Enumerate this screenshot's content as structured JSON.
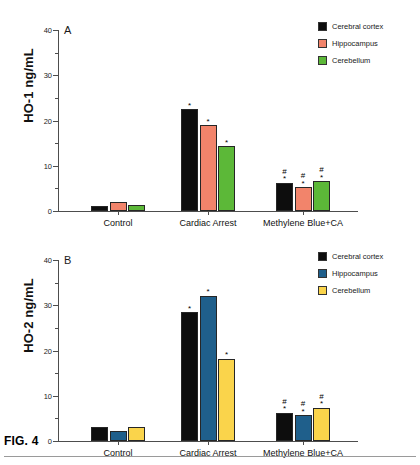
{
  "figure": {
    "caption": "FIG. 4"
  },
  "panels": [
    {
      "id": "a",
      "letter": "A",
      "ylabel": "HO-1 ng/mL",
      "legend": [
        {
          "label": "Cerebral cortex",
          "color": "#0d0d0d"
        },
        {
          "label": "Hippocampus",
          "color": "#F2846B"
        },
        {
          "label": "Cerebellum",
          "color": "#5CB838"
        }
      ]
    },
    {
      "id": "b",
      "letter": "B",
      "ylabel": "HO-2 ng/mL",
      "legend": [
        {
          "label": "Cerebral cortex",
          "color": "#0d0d0d"
        },
        {
          "label": "Hippocampus",
          "color": "#1F5F8B"
        },
        {
          "label": "Cerebellum",
          "color": "#FAD44B"
        }
      ]
    }
  ],
  "chart_data": [
    {
      "type": "bar",
      "panel": "A",
      "title": "A",
      "xlabel": "",
      "ylabel": "HO-1 ng/mL",
      "ylim": [
        0,
        40
      ],
      "yticks": [
        0,
        10,
        20,
        30,
        40
      ],
      "ytick_labels": [
        "0",
        "10",
        "20",
        "30",
        "40"
      ],
      "minor_tick_step": 5,
      "grid": false,
      "legend_position": "top-right",
      "categories": [
        "Control",
        "Cardiac Arrest",
        "Methylene Blue+CA"
      ],
      "series": [
        {
          "name": "Cerebral cortex",
          "color": "#0d0d0d",
          "values": [
            1.1,
            22.5,
            6.2
          ],
          "annotations": [
            "",
            "*",
            "#\n*"
          ]
        },
        {
          "name": "Hippocampus",
          "color": "#F2846B",
          "values": [
            2.0,
            19.0,
            5.3
          ],
          "annotations": [
            "",
            "*",
            "#\n*"
          ]
        },
        {
          "name": "Cerebellum",
          "color": "#5CB838",
          "values": [
            1.4,
            14.3,
            6.6
          ],
          "annotations": [
            "",
            "*",
            "#\n*"
          ]
        }
      ]
    },
    {
      "type": "bar",
      "panel": "B",
      "title": "B",
      "xlabel": "",
      "ylabel": "HO-2 ng/mL",
      "ylim": [
        0,
        40
      ],
      "yticks": [
        0,
        10,
        20,
        30,
        40
      ],
      "ytick_labels": [
        "0",
        "10",
        "20",
        "30",
        "40"
      ],
      "minor_tick_step": 5,
      "grid": false,
      "legend_position": "top-right",
      "categories": [
        "Control",
        "Cardiac Arrest",
        "Methylene Blue+CA"
      ],
      "series": [
        {
          "name": "Cerebral cortex",
          "color": "#0d0d0d",
          "values": [
            3.0,
            28.5,
            6.3
          ],
          "annotations": [
            "",
            "*",
            "#\n*"
          ]
        },
        {
          "name": "Hippocampus",
          "color": "#1F5F8B",
          "values": [
            2.2,
            32.1,
            5.7
          ],
          "annotations": [
            "",
            "*",
            "#\n*"
          ]
        },
        {
          "name": "Cerebellum",
          "color": "#FAD44B",
          "values": [
            3.2,
            18.2,
            7.3
          ],
          "annotations": [
            "",
            "*",
            "#\n*"
          ]
        }
      ]
    }
  ]
}
